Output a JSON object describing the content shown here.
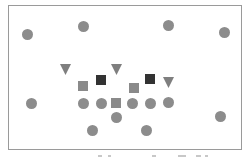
{
  "diagram": {
    "frame": {
      "x": 8,
      "y": 5,
      "width": 234,
      "height": 145,
      "border_color": "#9a9a9a"
    },
    "colors": {
      "circle": "#8c8c8c",
      "triangle": "#7f7f7f",
      "square_gray": "#8a8a8a",
      "square_dark": "#333333"
    },
    "shapes": [
      {
        "type": "circle",
        "x": 27,
        "y": 34,
        "size": 11
      },
      {
        "type": "circle",
        "x": 83,
        "y": 26,
        "size": 11
      },
      {
        "type": "circle",
        "x": 168,
        "y": 25,
        "size": 11
      },
      {
        "type": "circle",
        "x": 224,
        "y": 32,
        "size": 11
      },
      {
        "type": "triangle",
        "x": 65,
        "y": 69,
        "size": 11
      },
      {
        "type": "triangle",
        "x": 116,
        "y": 69,
        "size": 11
      },
      {
        "type": "triangle",
        "x": 168,
        "y": 82,
        "size": 11
      },
      {
        "type": "square_dark",
        "x": 101,
        "y": 80,
        "size": 10
      },
      {
        "type": "square_dark",
        "x": 150,
        "y": 79,
        "size": 10
      },
      {
        "type": "square_gray",
        "x": 83,
        "y": 86,
        "size": 10
      },
      {
        "type": "square_gray",
        "x": 134,
        "y": 88,
        "size": 10
      },
      {
        "type": "circle",
        "x": 31,
        "y": 103,
        "size": 11
      },
      {
        "type": "circle",
        "x": 83,
        "y": 103,
        "size": 11
      },
      {
        "type": "circle",
        "x": 101,
        "y": 103,
        "size": 11
      },
      {
        "type": "square_gray",
        "x": 116,
        "y": 103,
        "size": 10
      },
      {
        "type": "circle",
        "x": 132,
        "y": 103,
        "size": 11
      },
      {
        "type": "circle",
        "x": 150,
        "y": 103,
        "size": 11
      },
      {
        "type": "circle",
        "x": 168,
        "y": 102,
        "size": 11
      },
      {
        "type": "circle",
        "x": 116,
        "y": 117,
        "size": 11
      },
      {
        "type": "circle",
        "x": 220,
        "y": 116,
        "size": 11
      },
      {
        "type": "circle",
        "x": 92,
        "y": 130,
        "size": 11
      },
      {
        "type": "circle",
        "x": 146,
        "y": 130,
        "size": 11
      }
    ],
    "caption": {
      "text": "",
      "marks": [
        {
          "x": 98,
          "width": 4
        },
        {
          "x": 108,
          "width": 3
        },
        {
          "x": 152,
          "width": 4
        },
        {
          "x": 178,
          "width": 8
        },
        {
          "x": 196,
          "width": 5
        },
        {
          "x": 205,
          "width": 3
        }
      ]
    }
  }
}
